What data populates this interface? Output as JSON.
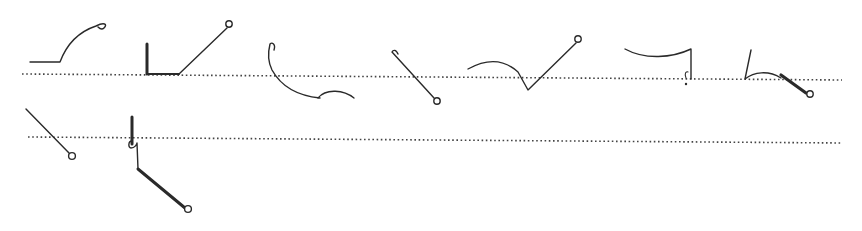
{
  "figure": {
    "type": "shorthand-outlines",
    "width": 862,
    "height": 231,
    "ink_color": "#2a2a2a",
    "background": "#ffffff",
    "baselines": [
      {
        "id": "line-1",
        "x1": 22,
        "y1": 74,
        "x2": 842,
        "y2": 80
      },
      {
        "id": "line-2",
        "x1": 28,
        "y1": 137,
        "x2": 842,
        "y2": 143
      }
    ],
    "glyphs": [
      {
        "id": "glyph-1",
        "line": 1,
        "strokes": [
          {
            "d": "M30,62 L60,62 C66,46 78,32 96,26 C104,22 108,24 104,28 C102,30 100,29 98,27",
            "width": 1.4
          }
        ],
        "circles": [],
        "dots": []
      },
      {
        "id": "glyph-2",
        "line": 1,
        "strokes": [
          {
            "d": "M147,44 L147,74",
            "width": 3
          },
          {
            "d": "M147,74 L179,74",
            "width": 2
          },
          {
            "d": "M179,74 L227,28",
            "width": 1.4
          }
        ],
        "circles": [
          {
            "cx": 229,
            "cy": 24,
            "r": 3.2
          }
        ],
        "dots": []
      },
      {
        "id": "glyph-3",
        "line": 1,
        "strokes": [
          {
            "d": "M274,50 C276,44 272,42 270,44 C268,52 268,62 272,70 C282,88 300,96 320,98",
            "width": 1.4
          },
          {
            "d": "M318,98 C326,88 344,90 354,98",
            "width": 1.3
          }
        ],
        "circles": [],
        "dots": []
      },
      {
        "id": "glyph-4",
        "line": 1,
        "strokes": [
          {
            "d": "M398,54 C396,49 393,50 392,52 L434,98",
            "width": 1.4
          }
        ],
        "circles": [
          {
            "cx": 437,
            "cy": 101,
            "r": 3.2
          }
        ],
        "dots": []
      },
      {
        "id": "glyph-5",
        "line": 1,
        "strokes": [
          {
            "d": "M468,69 C488,58 505,60 518,72 L528,90 L576,43",
            "width": 1.4
          }
        ],
        "circles": [
          {
            "cx": 578,
            "cy": 39,
            "r": 3.2
          }
        ],
        "dots": []
      },
      {
        "id": "glyph-6",
        "line": 1,
        "strokes": [
          {
            "d": "M625,49 C645,60 672,58 691,49 L691,79",
            "width": 1.4
          },
          {
            "d": "M686,78 C684,74 686,71 688,72",
            "width": 1.1
          }
        ],
        "circles": [],
        "dots": [
          {
            "cx": 686,
            "cy": 84,
            "r": 1.2
          }
        ]
      },
      {
        "id": "glyph-7",
        "line": 1,
        "strokes": [
          {
            "d": "M751,50 L745,79 C754,72 768,70 781,78",
            "width": 1.4
          },
          {
            "d": "M781,75 L806,93",
            "width": 3.2
          }
        ],
        "circles": [
          {
            "cx": 810,
            "cy": 94,
            "r": 3.2
          }
        ],
        "dots": []
      },
      {
        "id": "glyph-8",
        "line": 2,
        "strokes": [
          {
            "d": "M26,109 L69,153",
            "width": 1.4
          }
        ],
        "circles": [
          {
            "cx": 72,
            "cy": 156,
            "r": 3.4
          }
        ],
        "dots": []
      },
      {
        "id": "glyph-9",
        "line": 2,
        "strokes": [
          {
            "d": "M132,117 L132,144",
            "width": 3
          },
          {
            "d": "M132,141 C128,141 128,148 131,148 C135,148 137,144 137,143 L138,169",
            "width": 1.4
          },
          {
            "d": "M138,169 L185,208",
            "width": 3
          }
        ],
        "circles": [
          {
            "cx": 188,
            "cy": 209,
            "r": 3.4
          }
        ],
        "dots": []
      }
    ]
  }
}
